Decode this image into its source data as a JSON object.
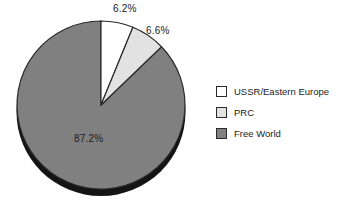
{
  "chart_data": {
    "type": "pie",
    "title": "",
    "subtitle": "",
    "xlabel": "",
    "ylabel": "",
    "legend_position": "right",
    "grid": false,
    "start_angle_deg": 0,
    "direction": "clockwise",
    "style": "3d-shadow",
    "categories": [
      "USSR/Eastern Europe",
      "PRC",
      "Free World"
    ],
    "values": [
      6.2,
      6.6,
      87.2
    ],
    "value_unit": "%",
    "data_labels": [
      "6.2%",
      "6.6%",
      "87.2%"
    ],
    "colors": [
      "#ffffff",
      "#e2e2e2",
      "#808080"
    ],
    "slices": [
      {
        "name": "USSR/Eastern Europe",
        "value": 6.2,
        "label": "6.2%",
        "color": "#ffffff",
        "path": "M 101 21 A 84 84 0 0 1 133.0 27.4 L 101 105 Z"
      },
      {
        "name": "PRC",
        "value": 6.6,
        "label": "6.6%",
        "color": "#e2e2e2",
        "path": "M 133.0 27.4 A 84 84 0 0 1 164.3 49.6 L 101 105 Z"
      },
      {
        "name": "Free World",
        "value": 87.2,
        "label": "87.2%",
        "color": "#808080",
        "path": "M 164.3 49.6 A 84 84 0 1 1 101 21 L 101 105 Z"
      }
    ]
  },
  "pie": {
    "center_x": 101,
    "center_y": 105,
    "radius": 84,
    "shadow_color": "#141414",
    "outline_color": "#2a2a2a",
    "labels": {
      "ussr": "6.2%",
      "prc": "6.6%",
      "free_world": "87.2%"
    }
  },
  "legend": {
    "items": [
      {
        "label": "USSR/Eastern Europe",
        "color": "#ffffff"
      },
      {
        "label": "PRC",
        "color": "#e2e2e2"
      },
      {
        "label": "Free World",
        "color": "#808080"
      }
    ]
  }
}
